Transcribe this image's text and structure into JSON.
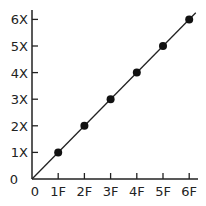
{
  "chart_data": {
    "type": "line",
    "title": "",
    "xlabel": "",
    "ylabel": "",
    "x": [
      1,
      2,
      3,
      4,
      5,
      6
    ],
    "x_tick_labels": [
      "0",
      "1F",
      "2F",
      "3F",
      "4F",
      "5F",
      "6F"
    ],
    "y_tick_labels": [
      "0",
      "1X",
      "2X",
      "3X",
      "4X",
      "5X",
      "6X"
    ],
    "series": [
      {
        "name": "proportional",
        "x": [
          1,
          2,
          3,
          4,
          5,
          6
        ],
        "y": [
          1,
          2,
          3,
          4,
          5,
          6
        ],
        "markers": true,
        "line_from_origin": true
      }
    ],
    "xlim": [
      0,
      6.3
    ],
    "ylim": [
      0,
      6.3
    ],
    "grid": false,
    "legend": null,
    "colors": {
      "line": "#222222",
      "marker": "#111111",
      "axis": "#222222"
    }
  }
}
